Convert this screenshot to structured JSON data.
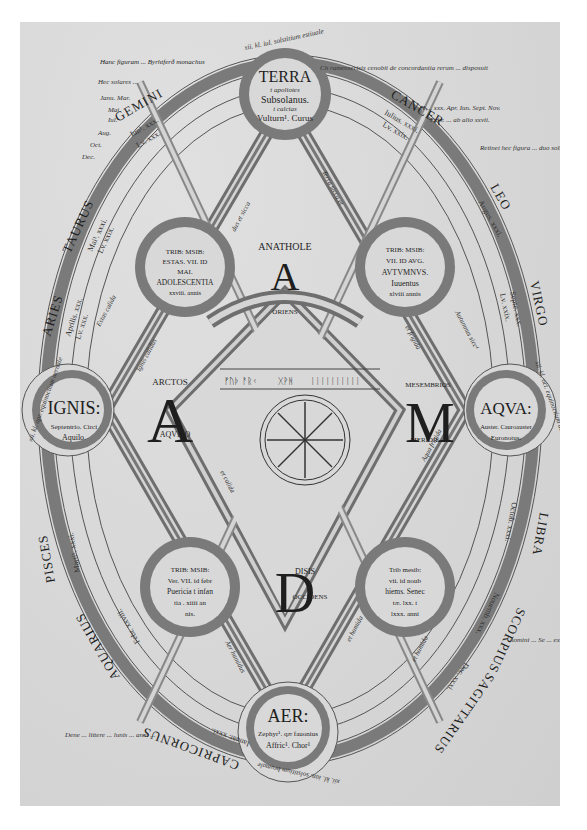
{
  "manuscript": {
    "title_line": "Hanc figuram ... Byrhtferð monachus",
    "margin_top_right": "Ch ramenserisis cenobii de concordantia rerum ... disposuit",
    "margin_top_left_notes": [
      "Hec solares ... ",
      "Janu. Mar.",
      "Mai.",
      "Iul.",
      "Aug.",
      "Oct.",
      "Dec."
    ],
    "margin_right_notes": [
      "H ... xxx. Apr. Iun. Sept. Nov.",
      "Febr. ... ab alio xxvii.",
      "Retinet hec figura ... duo solsticia ... duodecim ... nomina ..."
    ],
    "margin_right_bottom": "homini ... Se ... ex sinul ... cuncta ... bis bine ... littere ... nominis ... protoplasti ade",
    "margin_left_bottom": "Dene ... littere ... lunis ... anni ..."
  },
  "elements": {
    "terra": {
      "title": "TERRA",
      "line1": "t apoliotes",
      "line2": "Subsolanus.",
      "line3": "t calcias",
      "line4": "Vulturn¹. Curus"
    },
    "ignis": {
      "title": "IGNIS:",
      "line1": "Septentrio. Circi",
      "line2": "Aquilo."
    },
    "aqua": {
      "title": "AQVA:",
      "line1": "Auster. Cauroauster",
      "line2": "Euronotus."
    },
    "aer": {
      "title": "AER:",
      "line1": "Zephyr¹. qæ fauonius",
      "line2": "Affric¹. Chor¹"
    }
  },
  "seasons": {
    "summer": {
      "l1": "TRIB: MSIB:",
      "l2": "ESTAS. VII. ID",
      "l3": "MAI.",
      "l4": "ADOLESCENTIA",
      "l5": "xxviii. annis"
    },
    "autumn": {
      "l1": "TRIB: MSIB:",
      "l2": "VII. ID AVG.",
      "l3": "AVTVMNVS.",
      "l4": "Iuuentus",
      "l5": "xlviii annis"
    },
    "spring": {
      "l1": "TRIB: MSIB:",
      "l2": "Ver. VII. id febr",
      "l3": "Puericia t infan",
      "l4": "tia . xiiii an",
      "l5": "nis."
    },
    "winter": {
      "l1": "Trib mesib:",
      "l2": "vii. id noub",
      "l3": "hiems. Senec",
      "l4": "tæ. lxx. t",
      "l5": "lxxx. anni"
    }
  },
  "directions": {
    "east": {
      "name": "ANATHOLE",
      "letter": "A",
      "label": "ORIENS"
    },
    "north": {
      "name": "ARCTOS",
      "letter": "A",
      "label": "AQVILO"
    },
    "south": {
      "name": "MESEMBRIOS",
      "letter": "M",
      "label": "MERIDIE"
    },
    "west": {
      "name": "DISIS",
      "letter": "D",
      "label": "OCCIDENS"
    }
  },
  "qualities": {
    "hot_dry": "Estas calida",
    "dry_cold": "Autumnus sicc¹",
    "terra_sicca": "Terra sicca et",
    "frigida": "et frigida",
    "ignis_calidus": "Ignis calidus",
    "et_calida": "et calida",
    "aqua_frigida": "Aqua frigida",
    "et_humida": "et humida",
    "aer_humidus": "Aer humidus",
    "hiems_humida": "et humida",
    "dry_sicca": "Autumnus sicc¹",
    "estas_sicca": "dus et sicca"
  },
  "zodiac": [
    {
      "sign": "GEMINI",
      "dates": [
        "Iun¹. xxx.",
        "Lv. xxx."
      ]
    },
    {
      "sign": "CANCER",
      "dates": [
        "Iulius. xxxi.",
        "Lv. xxix."
      ]
    },
    {
      "sign": "LEO",
      "dates": [
        "Augus. xxxi.",
        "Lv. xxx."
      ]
    },
    {
      "sign": "VIRGO",
      "dates": [
        "Septe. xxx.",
        "Lv. xxix."
      ]
    },
    {
      "sign": "LIBRA",
      "dates": [
        "Octob. xxxi.",
        "Lv. xxx."
      ]
    },
    {
      "sign": "SCORPIUS",
      "dates": [
        "Nouemb. xxx.",
        "Lv. xxix."
      ]
    },
    {
      "sign": "SAGITTARIUS",
      "dates": [
        "Dec. xxxi.",
        "Lv. xxx."
      ]
    },
    {
      "sign": "CAPRICORNUS",
      "dates": [
        "Ianuar. xxxi.",
        "Lv. xxix."
      ]
    },
    {
      "sign": "AQUARIUS",
      "dates": [
        "Febr. xxviii.",
        "Lv. xxx."
      ]
    },
    {
      "sign": "PISCES",
      "dates": [
        "Marti¹. xxxi.",
        "Lv. xxix."
      ]
    },
    {
      "sign": "ARIES",
      "dates": [
        "Aprilis. xxx.",
        "Lv. xxx."
      ]
    },
    {
      "sign": "TAURUS",
      "dates": [
        "Mai¹. xxxi.",
        "Lv. xxix."
      ]
    }
  ],
  "equinox_solstice": {
    "top": "xii. kl. iul. solstitium estiuale",
    "left": "xii. kl. apr. equinoctium uernale",
    "right": "xii. kl. oct. equinoctium autumnale",
    "bottom": "xii. kl. ian. solstitium brumale"
  },
  "center": {
    "runes_left": "ᚠᚢᚦ ᚨᚱᚲ",
    "runes_mid": "ᚷᚹᚻ",
    "runes_right": "ᛁᛁᛁᛁᛁᛁᛁᛁᛁᛁ"
  },
  "colors": {
    "parchment": "#d9d9d9",
    "band": "#7a7a7a",
    "ink": "#1e1e1e",
    "band_light": "#c8c8c8"
  }
}
